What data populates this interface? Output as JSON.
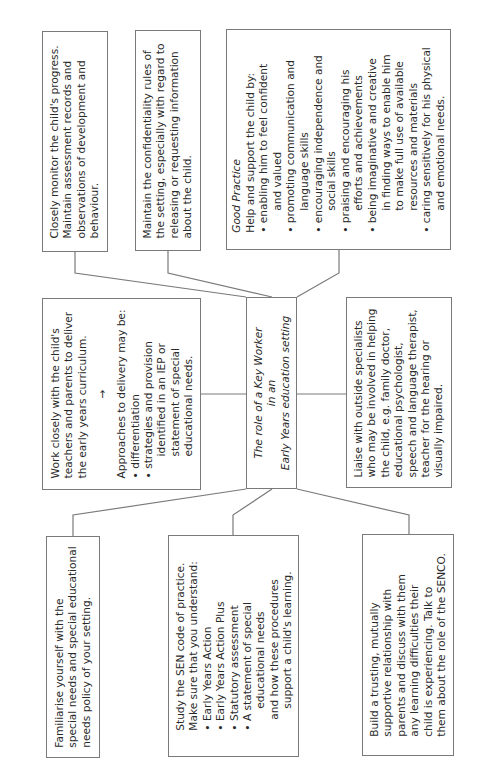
{
  "diagram": {
    "title_line1": "The role of a Key Worker",
    "title_line2": "in an",
    "title_line3": "Early Years education setting",
    "border_color": "#7a7a7a",
    "text_color": "#2a2a2a",
    "boxes": {
      "monitor": {
        "lines": [
          "Closely monitor the child's progress.",
          "Maintain assessment records and",
          "observations of development and",
          "behaviour."
        ]
      },
      "confidentiality": {
        "lines": [
          "Maintain the confidentiality rules of",
          "the setting, especially with regard to",
          "releasing or requesting information",
          "about the child."
        ]
      },
      "good_practice": {
        "heading": "Good Practice",
        "intro": "Help and support the child by:",
        "bullets": [
          [
            "enabling him to feel confident",
            "and valued"
          ],
          [
            "promoting communication and",
            "language skills"
          ],
          [
            "encouraging independence and",
            "social skills"
          ],
          [
            "praising and encouraging his",
            "efforts and achievements"
          ],
          [
            "being imaginative and creative",
            "in finding ways to enable him",
            "to make full use of available",
            "resources and materials"
          ],
          [
            "caring sensitively for his physical",
            "and emotional needs."
          ]
        ]
      },
      "work_closely": {
        "lines": [
          "Work closely with the child's",
          "teachers and parents to deliver",
          "the early years curriculum."
        ],
        "arrow": "→",
        "approaches": "Approaches to delivery may be:",
        "bullets": [
          [
            "differentiation"
          ],
          [
            "strategies and provision",
            "identified in an IEP or",
            "statement of special",
            "educational needs."
          ]
        ]
      },
      "liaise": {
        "lines": [
          "Liaise with outside specialists",
          "who may be involved in helping",
          "the child, e.g. family doctor,",
          "educational psychologist,",
          "speech and language therapist,",
          "teacher for the hearing or",
          "visually impaired."
        ]
      },
      "familiarise": {
        "lines": [
          "Familiarise yourself with the",
          "special needs and special educational",
          "needs policy of your setting."
        ]
      },
      "sen_code": {
        "lines": [
          "Study the SEN code of practice.",
          "Make sure that you understand:"
        ],
        "bullets": [
          [
            "Early Years Action"
          ],
          [
            "Early Years Action Plus"
          ],
          [
            "Statutory assessment"
          ],
          [
            "A statement of special",
            "educational needs"
          ]
        ],
        "tail": [
          "and how these procedures",
          "support a child's learning."
        ]
      },
      "build_trust": {
        "lines": [
          "Build a trusting, mutually",
          "supportive relationship with",
          "parents and discuss with them",
          "any learning difficulties their",
          "child is experiencing. Talk to",
          "them about the role of the SENCO."
        ]
      }
    }
  }
}
